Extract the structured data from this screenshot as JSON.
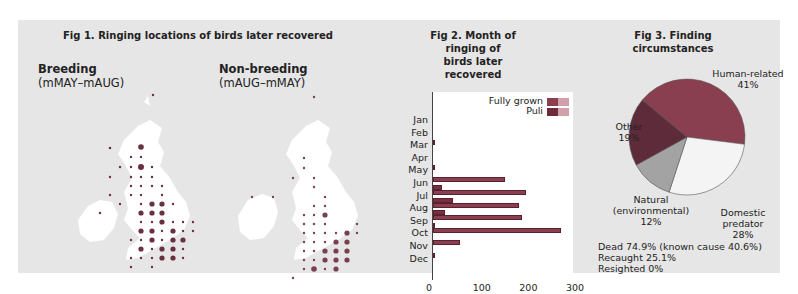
{
  "fig1": {
    "title": "Fig 1. Ringing locations of birds later recovered",
    "breeding": {
      "label": "Breeding",
      "period": "(mMAY–mAUG)"
    },
    "nonbreeding": {
      "label": "Non-breeding",
      "period": "(mAUG–mMAY)"
    }
  },
  "fig2": {
    "title_line1": "Fig 2. Month of ringing of",
    "title_line2": "birds later recovered",
    "legend": {
      "fully_grown": "Fully grown",
      "puli": "Puli"
    }
  },
  "fig3": {
    "title": "Fig 3. Finding circumstances",
    "labels": {
      "human": [
        "Human-related",
        "41%"
      ],
      "domestic": [
        "Domestic",
        "predator",
        "28%"
      ],
      "natural": [
        "Natural",
        "(environmental)",
        "12%"
      ],
      "other": [
        "Other",
        "19%"
      ]
    },
    "summary": {
      "dead": "Dead 74.9% (known cause 40.6%)",
      "recaught": "Recaught 25.1%",
      "resighted": "Resighted 0%"
    }
  },
  "colors": {
    "background": "#e6e6e6",
    "bar_fully_grown": "#8a3f50",
    "bar_puli": "#6e2a3a",
    "pie_human": "#8a3f50",
    "pie_domestic": "#f4f4f4",
    "pie_natural": "#a3a3a3",
    "pie_other": "#5e2b3a"
  },
  "chart_data": [
    {
      "type": "bar",
      "orientation": "horizontal",
      "title": "Fig 2. Month of ringing of birds later recovered",
      "categories": [
        "Jan",
        "Feb",
        "Mar",
        "Apr",
        "May",
        "Jun",
        "Jul",
        "Aug",
        "Sep",
        "Oct",
        "Nov",
        "Dec"
      ],
      "series": [
        {
          "name": "Fully grown",
          "values": [
            0,
            2,
            0,
            3,
            155,
            200,
            185,
            190,
            275,
            58,
            1,
            0
          ]
        },
        {
          "name": "Puli",
          "values": [
            0,
            0,
            0,
            0,
            0,
            20,
            42,
            25,
            5,
            0,
            0,
            0
          ]
        }
      ],
      "xlim": [
        0,
        300
      ],
      "xticks": [
        0,
        100,
        200,
        300
      ],
      "legend_position": "top-right"
    },
    {
      "type": "pie",
      "title": "Fig 3. Finding circumstances",
      "categories": [
        "Human-related",
        "Domestic predator",
        "Natural (environmental)",
        "Other"
      ],
      "values": [
        41,
        28,
        12,
        19
      ],
      "notes": [
        "Dead 74.9% (known cause 40.6%)",
        "Recaught 25.1%",
        "Resighted 0%"
      ]
    }
  ]
}
